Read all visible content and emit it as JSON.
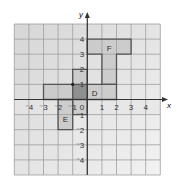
{
  "diagram": {
    "type": "coordinate-grid",
    "axes": {
      "x_label": "x",
      "y_label": "y",
      "x_range": [
        -5,
        5
      ],
      "y_range": [
        -5,
        5
      ],
      "x_ticks": [
        "⁻4",
        "⁻3",
        "⁻2",
        "⁻1",
        "1",
        "2",
        "3",
        "4"
      ],
      "x_tick_values": [
        -4,
        -3,
        -2,
        -1,
        1,
        2,
        3,
        4
      ],
      "y_ticks": [
        "4",
        "3",
        "2",
        "1",
        "⁻1",
        "⁻2",
        "⁻3",
        "⁻4"
      ],
      "y_tick_values": [
        4,
        3,
        2,
        1,
        -1,
        -2,
        -3,
        -4
      ],
      "origin_label": "0"
    },
    "shapes": [
      {
        "label": "F",
        "label_pos": [
          1.5,
          3.4
        ],
        "points": [
          [
            0,
            4
          ],
          [
            3,
            4
          ],
          [
            3,
            3
          ],
          [
            2,
            3
          ],
          [
            2,
            1
          ],
          [
            1,
            1
          ],
          [
            1,
            3
          ],
          [
            0,
            3
          ]
        ]
      },
      {
        "label": "D",
        "label_pos": [
          0.5,
          0.4
        ],
        "points": [
          [
            -3,
            1
          ],
          [
            2,
            1
          ],
          [
            2,
            0
          ],
          [
            -3,
            0
          ]
        ]
      },
      {
        "label": "",
        "points": [
          [
            -1,
            2
          ],
          [
            0,
            2
          ],
          [
            0,
            -1
          ],
          [
            -1,
            -1
          ]
        ]
      },
      {
        "label": "E",
        "label_pos": [
          -1.5,
          -1.3
        ],
        "points": [
          [
            -2,
            0
          ],
          [
            -1,
            0
          ],
          [
            -1,
            -2
          ],
          [
            -2,
            -2
          ]
        ]
      }
    ],
    "overlap_square": [
      [
        -1,
        1
      ],
      [
        0,
        1
      ],
      [
        0,
        0
      ],
      [
        -1,
        0
      ]
    ],
    "point_marker": [
      -1,
      1
    ],
    "colors": {
      "bg_top": "#d6d6d6",
      "bg_bottom": "#f2f2f2",
      "grid": "#9e9e9e",
      "shape_fill": "#c4c4c4",
      "overlap_fill": "#8f8f8f",
      "outline": "#555555",
      "axis": "#333333",
      "text": "#333333"
    }
  }
}
